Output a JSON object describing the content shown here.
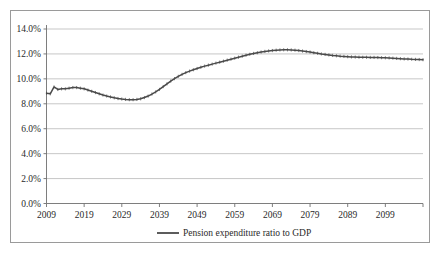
{
  "chart_data": {
    "type": "line",
    "title": "",
    "xlabel": "",
    "ylabel": "",
    "grid": true,
    "legend_position": "bottom",
    "ylim": [
      0.0,
      14.0
    ],
    "ytick_labels": [
      "0.0%",
      "2.0%",
      "4.0%",
      "6.0%",
      "8.0%",
      "10.0%",
      "12.0%",
      "14.0%"
    ],
    "ytick_values": [
      0.0,
      2.0,
      4.0,
      6.0,
      8.0,
      10.0,
      12.0,
      14.0
    ],
    "xlim": [
      2009,
      2109
    ],
    "xtick_labels": [
      "2009",
      "2019",
      "2029",
      "2039",
      "2049",
      "2059",
      "2069",
      "2079",
      "2089",
      "2099"
    ],
    "xtick_values": [
      2009,
      2019,
      2029,
      2039,
      2049,
      2059,
      2069,
      2079,
      2089,
      2099
    ],
    "series": [
      {
        "name": "Pension expenditure ratio to GDP",
        "color": "#4a4a4a",
        "x": [
          2009,
          2010,
          2011,
          2012,
          2013,
          2014,
          2015,
          2016,
          2017,
          2018,
          2019,
          2020,
          2021,
          2022,
          2023,
          2024,
          2025,
          2026,
          2027,
          2028,
          2029,
          2030,
          2031,
          2032,
          2033,
          2034,
          2035,
          2036,
          2037,
          2038,
          2039,
          2040,
          2041,
          2042,
          2043,
          2044,
          2045,
          2046,
          2047,
          2048,
          2049,
          2050,
          2051,
          2052,
          2053,
          2054,
          2055,
          2056,
          2057,
          2058,
          2059,
          2060,
          2061,
          2062,
          2063,
          2064,
          2065,
          2066,
          2067,
          2068,
          2069,
          2070,
          2071,
          2072,
          2073,
          2074,
          2075,
          2076,
          2077,
          2078,
          2079,
          2080,
          2081,
          2082,
          2083,
          2084,
          2085,
          2086,
          2087,
          2088,
          2089,
          2090,
          2091,
          2092,
          2093,
          2094,
          2095,
          2096,
          2097,
          2098,
          2099,
          2100,
          2101,
          2102,
          2103,
          2104,
          2105,
          2106,
          2107,
          2108,
          2109
        ],
        "values": [
          8.85,
          8.8,
          9.35,
          9.15,
          9.2,
          9.2,
          9.25,
          9.3,
          9.3,
          9.25,
          9.2,
          9.1,
          9.0,
          8.9,
          8.8,
          8.7,
          8.62,
          8.55,
          8.48,
          8.42,
          8.38,
          8.35,
          8.33,
          8.33,
          8.35,
          8.4,
          8.5,
          8.62,
          8.78,
          8.95,
          9.15,
          9.38,
          9.6,
          9.82,
          10.02,
          10.2,
          10.36,
          10.5,
          10.62,
          10.73,
          10.83,
          10.93,
          11.02,
          11.1,
          11.18,
          11.26,
          11.34,
          11.42,
          11.5,
          11.58,
          11.66,
          11.74,
          11.82,
          11.9,
          11.97,
          12.04,
          12.1,
          12.15,
          12.2,
          12.24,
          12.27,
          12.3,
          12.32,
          12.33,
          12.33,
          12.32,
          12.3,
          12.27,
          12.23,
          12.19,
          12.15,
          12.1,
          12.05,
          12.0,
          11.96,
          11.92,
          11.88,
          11.85,
          11.82,
          11.8,
          11.78,
          11.76,
          11.75,
          11.74,
          11.73,
          11.73,
          11.72,
          11.72,
          11.71,
          11.7,
          11.69,
          11.68,
          11.66,
          11.64,
          11.62,
          11.6,
          11.59,
          11.57,
          11.56,
          11.55,
          11.54
        ]
      }
    ]
  },
  "legend": {
    "entries": [
      {
        "label": "Pension expenditure ratio to GDP"
      }
    ]
  }
}
